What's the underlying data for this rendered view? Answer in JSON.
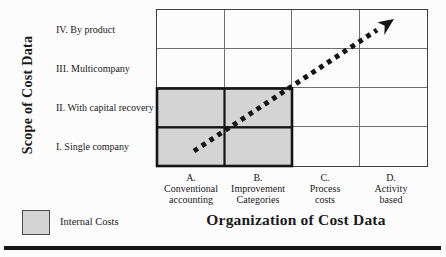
{
  "diagram": {
    "y_axis_title": "Scope of Cost Data",
    "x_axis_title": "Organization of Cost Data",
    "row_labels": [
      "IV. By product",
      "III. Multicompany",
      "II. With capital recovery",
      "I. Single company"
    ],
    "column_labels": [
      {
        "id": "A.",
        "line1": "Conventional",
        "line2": "accounting"
      },
      {
        "id": "B.",
        "line1": "Improvement",
        "line2": "Categories"
      },
      {
        "id": "C.",
        "line1": "Process",
        "line2": "costs"
      },
      {
        "id": "D.",
        "line1": "Activity",
        "line2": "based"
      }
    ],
    "legend": {
      "label": "Internal Costs"
    },
    "shaded_region": "columns A-B by rows I-II",
    "arrow": {
      "style": "dotted",
      "from": "cell A / row I",
      "to": "cell D / row IV"
    }
  },
  "colors": {
    "background": "#fcfcfc",
    "shaded_fill": "#d4d4d4",
    "thin_grid_line": "#6f6f6f",
    "emphasis_line": "#151515",
    "arrow": "#151515",
    "text": "#1a1a1a"
  }
}
